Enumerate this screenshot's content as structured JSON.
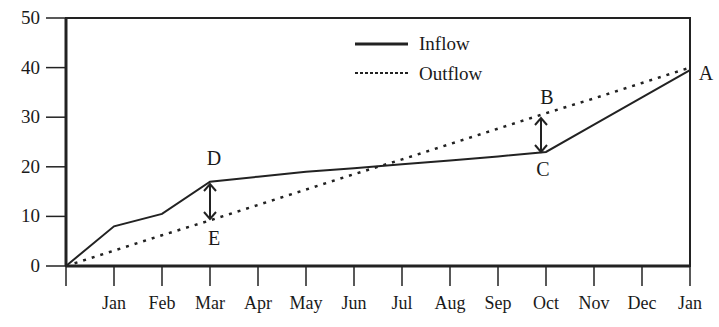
{
  "chart_data": {
    "type": "line",
    "title": "",
    "xlabel": "",
    "ylabel": "",
    "ylim": [
      0,
      50
    ],
    "yticks": [
      0,
      10,
      20,
      30,
      40,
      50
    ],
    "grid": false,
    "legend_position": "top-center",
    "x": [
      "",
      "Jan",
      "Feb",
      "Mar",
      "Apr",
      "May",
      "Jun",
      "Jul",
      "Aug",
      "Sep",
      "Oct",
      "Nov",
      "Dec",
      "Jan"
    ],
    "series": [
      {
        "name": "Inflow",
        "style": "solid",
        "values": [
          0,
          8,
          10.5,
          17,
          18,
          19,
          19.7,
          20.5,
          21.3,
          22.1,
          23,
          28.5,
          34,
          39.5
        ]
      },
      {
        "name": "Outflow",
        "style": "dotted",
        "values": [
          0,
          3.1,
          6.2,
          9.2,
          12.3,
          15.4,
          18.5,
          21.5,
          24.6,
          27.7,
          30.8,
          33.8,
          36.9,
          40
        ]
      }
    ],
    "annotations": [
      {
        "label": "A",
        "x": "Jan",
        "y": 40
      },
      {
        "label": "B",
        "x": "Oct",
        "y": 30.8
      },
      {
        "label": "C",
        "x": "Oct",
        "y": 23
      },
      {
        "label": "D",
        "x": "Mar",
        "y": 17
      },
      {
        "label": "E",
        "x": "Mar",
        "y": 9.2
      }
    ],
    "arrows": [
      {
        "between": [
          "D",
          "E"
        ],
        "x": "Mar"
      },
      {
        "between": [
          "B",
          "C"
        ],
        "x": "Oct"
      }
    ]
  },
  "legend": {
    "inflow": "Inflow",
    "outflow": "Outflow"
  },
  "y_ticks": [
    "0",
    "10",
    "20",
    "30",
    "40",
    "50"
  ],
  "x_ticks": [
    "Jan",
    "Feb",
    "Mar",
    "Apr",
    "May",
    "Jun",
    "Jul",
    "Aug",
    "Sep",
    "Oct",
    "Nov",
    "Dec",
    "Jan"
  ],
  "labels": {
    "A": "A",
    "B": "B",
    "C": "C",
    "D": "D",
    "E": "E"
  }
}
